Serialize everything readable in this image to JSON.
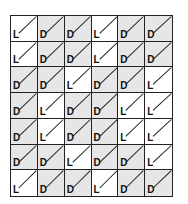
{
  "grid": {
    "rows": [
      [
        "L",
        "D",
        "D",
        "L",
        "D",
        "D"
      ],
      [
        "L",
        "D",
        "D",
        "L",
        "D",
        "D"
      ],
      [
        "D",
        "D",
        "L",
        "D",
        "D",
        "L"
      ],
      [
        "D",
        "L",
        "D",
        "D",
        "L",
        "L"
      ],
      [
        "D",
        "L",
        "D",
        "D",
        "L",
        "L"
      ],
      [
        "D",
        "D",
        "L",
        "D",
        "D",
        "L"
      ],
      [
        "L",
        "D",
        "D",
        "L",
        "D",
        "D"
      ]
    ],
    "legend": {
      "L": "light cell",
      "D": "dark cell"
    },
    "colors": {
      "L": "#ffffff",
      "D": "#e6e6e6",
      "line": "#222222"
    },
    "cell_icon": "diagonal-line-icon"
  }
}
